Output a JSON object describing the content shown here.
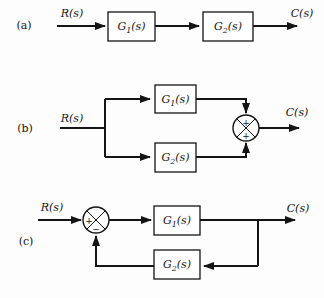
{
  "figure": {
    "ink_color": "#141414",
    "background_color": "#fdfdfd",
    "parts": [
      {
        "label": "(a)",
        "input": "R(s)",
        "output": "C(s)",
        "block1": {
          "base": "G",
          "sub": "1",
          "arg": "(s)"
        },
        "block2": {
          "base": "G",
          "sub": "2",
          "arg": "(s)"
        }
      },
      {
        "label": "(b)",
        "input": "R(s)",
        "output": "C(s)",
        "block1": {
          "base": "G",
          "sub": "1",
          "arg": "(s)"
        },
        "block2": {
          "base": "G",
          "sub": "2",
          "arg": "(s)"
        },
        "sum": {
          "top": "+",
          "bottom": "+"
        }
      },
      {
        "label": "(c)",
        "input": "R(s)",
        "output": "C(s)",
        "block1": {
          "base": "G",
          "sub": "1",
          "arg": "(s)"
        },
        "block2": {
          "base": "G",
          "sub": "2",
          "arg": "(s)"
        },
        "sum": {
          "left": "+",
          "bottom": "−"
        }
      }
    ]
  }
}
